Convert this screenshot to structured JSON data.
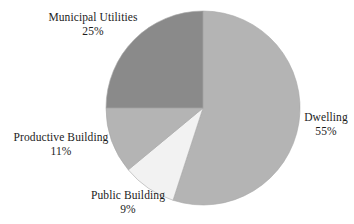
{
  "chart_data": {
    "type": "pie",
    "title": "",
    "subtitle": "",
    "xlabel": "",
    "ylabel": "",
    "grid": false,
    "legend_position": "none",
    "label_format": "name + percent",
    "start_angle_deg": 0,
    "direction": "clockwise",
    "categories": [
      "Dwelling",
      "Public Building",
      "Productive Building",
      "Municipal Utilities"
    ],
    "values": [
      55,
      9,
      11,
      25
    ],
    "units": "%",
    "total": 100,
    "slices": [
      {
        "name": "Dwelling",
        "value": 55,
        "percent_text": "55%",
        "color": "#b4b4b4",
        "start_angle_deg": 0,
        "end_angle_deg": 198,
        "label_position": "right"
      },
      {
        "name": "Public Building",
        "value": 9,
        "percent_text": "9%",
        "color": "#f2f2f2",
        "start_angle_deg": 198,
        "end_angle_deg": 230.4,
        "label_position": "bottom"
      },
      {
        "name": "Productive Building",
        "value": 11,
        "percent_text": "11%",
        "color": "#b4b4b4",
        "start_angle_deg": 230.4,
        "end_angle_deg": 270,
        "label_position": "left"
      },
      {
        "name": "Municipal Utilities",
        "value": 25,
        "percent_text": "25%",
        "color": "#8a8a8a",
        "start_angle_deg": 270,
        "end_angle_deg": 360,
        "label_position": "top-left"
      }
    ]
  },
  "labels": {
    "municipal_utilities": {
      "name": "Municipal Utilities",
      "percent": "25%"
    },
    "dwelling": {
      "name": "Dwelling",
      "percent": "55%"
    },
    "productive_building": {
      "name": "Productive Building",
      "percent": "11%"
    },
    "public_building": {
      "name": "Public Building",
      "percent": "9%"
    }
  },
  "colors": {
    "background": "#ffffff",
    "text": "#1c1c1c",
    "slice_dwelling": "#b4b4b4",
    "slice_public_building": "#f2f2f2",
    "slice_productive_building": "#b4b4b4",
    "slice_municipal_utilities": "#8a8a8a",
    "slice_outline": "#a8a8a8"
  },
  "geometry": {
    "center_x": 203,
    "center_y": 108,
    "radius": 97
  }
}
